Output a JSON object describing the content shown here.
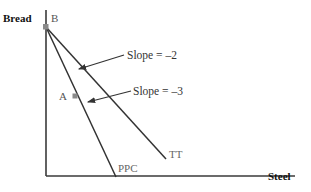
{
  "figure": {
    "type": "economics-ppc-diagram",
    "background_color": "#ffffff"
  },
  "axes": {
    "y_axis_label": "Bread",
    "x_axis_label": "Steel",
    "axis_color": "#3a3a3a",
    "origin": [
      46,
      176
    ],
    "y_axis_top": [
      46,
      10
    ],
    "x_axis_right": [
      295,
      176
    ]
  },
  "points": [
    {
      "id": "point-b",
      "label": "B",
      "label_color": "#555555",
      "marker_color": "#8a8a8a",
      "x": 46,
      "y": 27,
      "label_x": 51,
      "label_y": 22
    },
    {
      "id": "point-a",
      "label": "A",
      "label_color": "#555555",
      "marker_color": "#8a8a8a",
      "x": 75,
      "y": 96,
      "label_x": 59,
      "label_y": 100
    }
  ],
  "curves": [
    {
      "id": "ppc-line",
      "label": "PPC",
      "label_color": "#666666",
      "slope_text": "Slope = –3",
      "slope_value": -3,
      "color": "#333333",
      "x1": 46,
      "y1": 27,
      "x2": 116,
      "y2": 177,
      "label_x": 118,
      "label_y": 172
    },
    {
      "id": "tt-line",
      "label": "TT",
      "label_color": "#666666",
      "slope_text": "Slope = –2",
      "slope_value": -2,
      "color": "#333333",
      "x1": 46,
      "y1": 27,
      "x2": 166,
      "y2": 159,
      "label_x": 169,
      "label_y": 158
    }
  ],
  "annotations": [
    {
      "id": "slope-2-annotation",
      "text": "Slope = –2",
      "text_x": 127,
      "text_y": 59,
      "leader_from": [
        124,
        55
      ],
      "leader_to": [
        79,
        69
      ],
      "color": "#333333"
    },
    {
      "id": "slope-3-annotation",
      "text": "Slope = –3",
      "text_x": 133,
      "text_y": 95,
      "leader_from": [
        131,
        91
      ],
      "leader_to": [
        88,
        102
      ],
      "color": "#333333"
    }
  ],
  "colors": {
    "axis": "#3a3a3a",
    "line": "#333333",
    "marker": "#8a8a8a",
    "gray_text": "#666666",
    "dark_text": "#111111"
  }
}
